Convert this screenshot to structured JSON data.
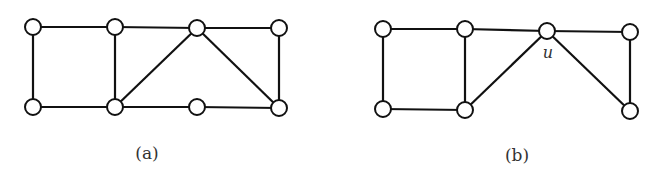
{
  "figure": {
    "node_radius": 8,
    "colors": {
      "stroke": "#111111",
      "fill": "#ffffff",
      "text": "#333333"
    },
    "graphs": [
      {
        "id": "a",
        "caption": "(a)",
        "caption_pos": [
          147,
          154
        ],
        "nodes": [
          {
            "id": "a1",
            "x": 33,
            "y": 27
          },
          {
            "id": "a2",
            "x": 115,
            "y": 27
          },
          {
            "id": "a3",
            "x": 197,
            "y": 28
          },
          {
            "id": "a4",
            "x": 279,
            "y": 28
          },
          {
            "id": "a5",
            "x": 33,
            "y": 107
          },
          {
            "id": "a6",
            "x": 115,
            "y": 107
          },
          {
            "id": "a7",
            "x": 197,
            "y": 107
          },
          {
            "id": "a8",
            "x": 279,
            "y": 108
          }
        ],
        "edges": [
          [
            "a1",
            "a2"
          ],
          [
            "a2",
            "a3"
          ],
          [
            "a3",
            "a4"
          ],
          [
            "a1",
            "a5"
          ],
          [
            "a2",
            "a6"
          ],
          [
            "a4",
            "a8"
          ],
          [
            "a5",
            "a6"
          ],
          [
            "a6",
            "a7"
          ],
          [
            "a7",
            "a8"
          ],
          [
            "a6",
            "a3"
          ],
          [
            "a3",
            "a8"
          ]
        ],
        "vertex_labels": []
      },
      {
        "id": "b",
        "caption": "(b)",
        "caption_pos": [
          517,
          156
        ],
        "nodes": [
          {
            "id": "b1",
            "x": 383,
            "y": 29
          },
          {
            "id": "b2",
            "x": 465,
            "y": 29
          },
          {
            "id": "u",
            "x": 547,
            "y": 31
          },
          {
            "id": "b4",
            "x": 630,
            "y": 32
          },
          {
            "id": "b5",
            "x": 383,
            "y": 109
          },
          {
            "id": "b6",
            "x": 465,
            "y": 110
          },
          {
            "id": "b7",
            "x": 630,
            "y": 111
          }
        ],
        "edges": [
          [
            "b1",
            "b2"
          ],
          [
            "b2",
            "u"
          ],
          [
            "u",
            "b4"
          ],
          [
            "b1",
            "b5"
          ],
          [
            "b2",
            "b6"
          ],
          [
            "b4",
            "b7"
          ],
          [
            "b5",
            "b6"
          ],
          [
            "b6",
            "u"
          ],
          [
            "u",
            "b7"
          ]
        ],
        "vertex_labels": [
          {
            "node": "u",
            "text": "u",
            "x": 548,
            "y": 58
          }
        ]
      }
    ]
  }
}
